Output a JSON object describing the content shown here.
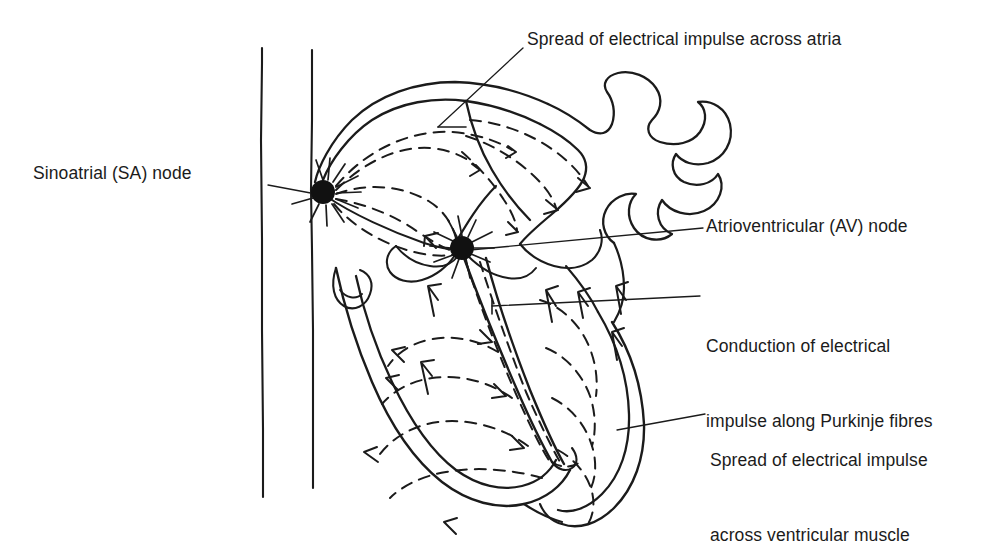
{
  "figure": {
    "type": "anatomical-line-diagram",
    "background_color": "#ffffff",
    "stroke_color": "#1b1b1b",
    "node_color": "#111111",
    "label_color": "#1b1b1b"
  },
  "labels": {
    "sa_node": "Sinoatrial (SA) node",
    "spread_atria": "Spread of electrical impulse across atria",
    "av_node": "Atrioventricular (AV) node",
    "purkinje_line1": "Conduction of electrical",
    "purkinje_line2": "impulse along Purkinje fibres",
    "ventricle_line1": "Spread of electrical impulse",
    "ventricle_line2": "across ventricular muscle"
  },
  "nodes": [
    {
      "name": "sa-node",
      "label": "Sinoatrial (SA) node",
      "x": 323,
      "y": 192,
      "radius": 12
    },
    {
      "name": "av-node",
      "label": "Atrioventricular (AV) node",
      "x": 462,
      "y": 248,
      "radius": 12
    }
  ],
  "leader_lines": [
    {
      "name": "sa-node-leader",
      "from": [
        268,
        185
      ],
      "to": [
        316,
        194
      ]
    },
    {
      "name": "atria-leader",
      "from": [
        523,
        48
      ],
      "to": [
        438,
        127
      ]
    },
    {
      "name": "av-node-leader",
      "from": [
        703,
        228
      ],
      "to": [
        470,
        250
      ]
    },
    {
      "name": "purkinje-leader",
      "from": [
        700,
        296
      ],
      "to": [
        492,
        306
      ]
    },
    {
      "name": "ventricle-leader",
      "from": [
        705,
        414
      ],
      "to": [
        617,
        430
      ]
    }
  ],
  "structures": [
    "superior vena cava",
    "right atrium",
    "left atrium",
    "pulmonary veins",
    "tricuspid valve",
    "mitral valve",
    "interventricular septum",
    "right ventricle",
    "left ventricle",
    "cardiac apex"
  ],
  "impulse_paths": {
    "atrial_spread": "dashed arcs radiating from SA node to AV node and across both atria",
    "purkinje": "dashed lines descending the interventricular septum from the AV node",
    "ventricular_spread": "dashed arcs sweeping upward through right and left ventricular walls"
  }
}
